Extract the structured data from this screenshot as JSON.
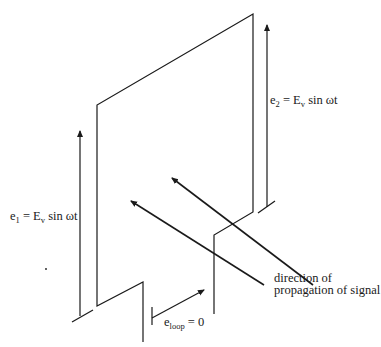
{
  "diagram": {
    "title": "",
    "labels": {
      "e2": {
        "base": "e",
        "sub": "2",
        "rest": " = E",
        "sub2": "v",
        "tail": " sin ωt"
      },
      "e1": {
        "base": "e",
        "sub": "1",
        "rest": " = E",
        "sub2": "v",
        "tail": " sin ωt"
      },
      "eloop": {
        "base": "e",
        "sub": "loop",
        "tail": " = 0"
      },
      "direction_line1": "direction of",
      "direction_line2": "propagation of signal"
    },
    "elements": [
      "loop-antenna-plate",
      "voltage-arrow-e1",
      "voltage-arrow-e2",
      "loop-voltage-arrow",
      "signal-propagation-arrows"
    ],
    "colors": {
      "line": "#1a1a1a",
      "background": "#ffffff"
    }
  }
}
